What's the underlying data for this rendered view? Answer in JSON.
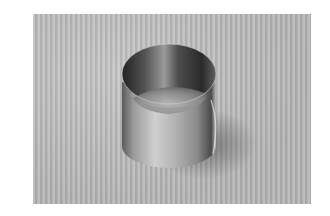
{
  "image": {
    "description": "Photograph of a polished stainless steel cylindrical ring mold standing on a light gray vertically-striped textured surface, with a soft shadow to the lower right",
    "subject": "stainless steel ring mold",
    "colors": {
      "page_background": "#ffffff",
      "surface": "#b9b9b9",
      "metal_light": "#d8d8d8",
      "metal_mid": "#8e8e8e",
      "metal_dark": "#2e2e2e",
      "shadow": "#6e6e6e"
    }
  }
}
